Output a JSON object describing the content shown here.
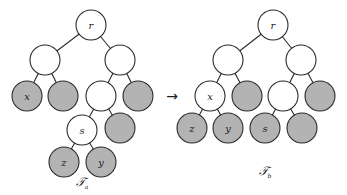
{
  "diagram": {
    "node_radius": 15,
    "colors": {
      "white_node": "#ffffff",
      "gray_node": "#b3b3b3",
      "stroke": "#2a2a2a"
    },
    "arrow": {
      "glyph": "→",
      "x": 172,
      "y": 96
    },
    "trees": [
      {
        "id": "Ta",
        "label": "𝒯",
        "label_sub": "a",
        "label_pos": {
          "x": 82,
          "y": 186
        },
        "nodes": [
          {
            "id": "r",
            "label": "r",
            "x": 91,
            "y": 25,
            "fill": "white"
          },
          {
            "id": "a1",
            "label": "",
            "x": 45,
            "y": 60,
            "fill": "white"
          },
          {
            "id": "a2",
            "label": "",
            "x": 120,
            "y": 60,
            "fill": "white"
          },
          {
            "id": "x",
            "label": "x",
            "x": 27,
            "y": 96,
            "fill": "gray"
          },
          {
            "id": "a4",
            "label": "",
            "x": 63,
            "y": 96,
            "fill": "gray"
          },
          {
            "id": "a5",
            "label": "",
            "x": 101,
            "y": 96,
            "fill": "white"
          },
          {
            "id": "a6",
            "label": "",
            "x": 138,
            "y": 96,
            "fill": "gray"
          },
          {
            "id": "s",
            "label": "s",
            "x": 82,
            "y": 130,
            "fill": "white"
          },
          {
            "id": "a8",
            "label": "",
            "x": 120,
            "y": 128,
            "fill": "gray"
          },
          {
            "id": "z",
            "label": "z",
            "x": 64,
            "y": 162,
            "fill": "gray"
          },
          {
            "id": "y",
            "label": "y",
            "x": 101,
            "y": 162,
            "fill": "gray"
          }
        ],
        "edges": [
          [
            "r",
            "a1"
          ],
          [
            "r",
            "a2"
          ],
          [
            "a1",
            "x"
          ],
          [
            "a1",
            "a4"
          ],
          [
            "a2",
            "a5"
          ],
          [
            "a2",
            "a6"
          ],
          [
            "a5",
            "s"
          ],
          [
            "a5",
            "a8"
          ],
          [
            "s",
            "z"
          ],
          [
            "s",
            "y"
          ]
        ]
      },
      {
        "id": "Tb",
        "label": "𝒯",
        "label_sub": "b",
        "label_pos": {
          "x": 265,
          "y": 175
        },
        "nodes": [
          {
            "id": "r",
            "label": "r",
            "x": 273,
            "y": 25,
            "fill": "white"
          },
          {
            "id": "b1",
            "label": "",
            "x": 228,
            "y": 60,
            "fill": "white"
          },
          {
            "id": "b2",
            "label": "",
            "x": 301,
            "y": 60,
            "fill": "white"
          },
          {
            "id": "x",
            "label": "x",
            "x": 210,
            "y": 96,
            "fill": "white"
          },
          {
            "id": "b4",
            "label": "",
            "x": 247,
            "y": 96,
            "fill": "gray"
          },
          {
            "id": "b5",
            "label": "",
            "x": 283,
            "y": 96,
            "fill": "white"
          },
          {
            "id": "b6",
            "label": "",
            "x": 320,
            "y": 96,
            "fill": "gray"
          },
          {
            "id": "z",
            "label": "z",
            "x": 192,
            "y": 128,
            "fill": "gray"
          },
          {
            "id": "y",
            "label": "y",
            "x": 228,
            "y": 128,
            "fill": "gray"
          },
          {
            "id": "s",
            "label": "s",
            "x": 265,
            "y": 128,
            "fill": "gray"
          },
          {
            "id": "b10",
            "label": "",
            "x": 302,
            "y": 128,
            "fill": "gray"
          }
        ],
        "edges": [
          [
            "r",
            "b1"
          ],
          [
            "r",
            "b2"
          ],
          [
            "b1",
            "x"
          ],
          [
            "b1",
            "b4"
          ],
          [
            "b2",
            "b5"
          ],
          [
            "b2",
            "b6"
          ],
          [
            "x",
            "z"
          ],
          [
            "x",
            "y"
          ],
          [
            "b5",
            "s"
          ],
          [
            "b5",
            "b10"
          ]
        ]
      }
    ]
  }
}
